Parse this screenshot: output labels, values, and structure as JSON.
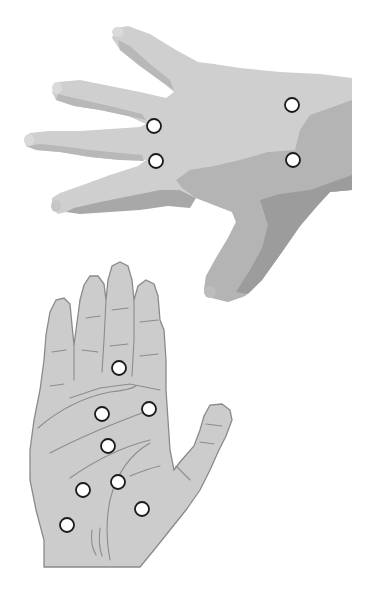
{
  "illustration": {
    "description": "Two hands with marked pressure points",
    "colors": {
      "background": "#ffffff",
      "back_hand_light": "#cfcfcf",
      "back_hand_mid": "#b3b3b3",
      "back_hand_dark": "#9a9a9a",
      "palm_fill": "#cccccc",
      "palm_outline": "#8a8a8a",
      "point_fill": "#ffffff",
      "point_stroke": "#1a1a1a"
    },
    "back_of_hand": {
      "orientation": "pointing left, fingers spread",
      "points": [
        {
          "id": "back-1",
          "cx": 154,
          "cy": 126
        },
        {
          "id": "back-2",
          "cx": 156,
          "cy": 161
        },
        {
          "id": "back-3",
          "cx": 292,
          "cy": 105
        },
        {
          "id": "back-4",
          "cx": 293,
          "cy": 160
        }
      ]
    },
    "palm": {
      "orientation": "upright, palm facing viewer",
      "points": [
        {
          "id": "palm-1",
          "cx": 119,
          "cy": 368
        },
        {
          "id": "palm-2",
          "cx": 102,
          "cy": 414
        },
        {
          "id": "palm-3",
          "cx": 149,
          "cy": 409
        },
        {
          "id": "palm-4",
          "cx": 108,
          "cy": 446
        },
        {
          "id": "palm-5",
          "cx": 118,
          "cy": 482
        },
        {
          "id": "palm-6",
          "cx": 83,
          "cy": 490
        },
        {
          "id": "palm-7",
          "cx": 142,
          "cy": 509
        },
        {
          "id": "palm-8",
          "cx": 67,
          "cy": 525
        }
      ]
    }
  }
}
